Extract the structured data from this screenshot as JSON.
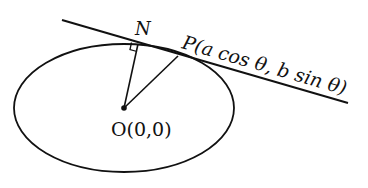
{
  "diagram": {
    "type": "ellipse-tangent-perpendicular",
    "labels": {
      "N": "N",
      "P": "P(a cos θ, b sin θ)",
      "O": "O(0,0)"
    },
    "points": {
      "O": {
        "name": "O",
        "coords": "(0,0)"
      },
      "P": {
        "name": "P",
        "coords": "(a cos θ, b sin θ)"
      },
      "N": {
        "name": "N",
        "description": "foot of perpendicular from O to tangent at P"
      }
    },
    "elements": [
      "ellipse",
      "tangent line at P",
      "segment ON (perpendicular)",
      "segment OP",
      "right-angle marker at N"
    ],
    "colors": {
      "stroke": "#111111",
      "background": "#ffffff"
    }
  }
}
